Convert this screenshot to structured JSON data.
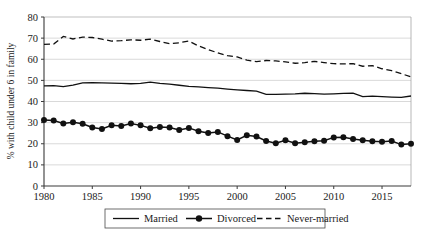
{
  "chart_data": {
    "type": "line",
    "title": "",
    "xlabel": "",
    "ylabel": "% with child under 6 in family",
    "xlim": [
      1980,
      2018
    ],
    "ylim": [
      0,
      80
    ],
    "ytick_step": 10,
    "xtick_step": 5,
    "grid": true,
    "legend_position": "bottom",
    "x": [
      1980,
      1981,
      1982,
      1983,
      1984,
      1985,
      1986,
      1987,
      1988,
      1989,
      1990,
      1991,
      1992,
      1993,
      1994,
      1995,
      1996,
      1997,
      1998,
      1999,
      2000,
      2001,
      2002,
      2003,
      2004,
      2005,
      2006,
      2007,
      2008,
      2009,
      2010,
      2011,
      2012,
      2013,
      2014,
      2015,
      2016,
      2017,
      2018
    ],
    "xticks": [
      1980,
      1985,
      1990,
      1995,
      2000,
      2005,
      2010,
      2015
    ],
    "yticks": [
      0,
      10,
      20,
      30,
      40,
      50,
      60,
      70,
      80
    ],
    "series": [
      {
        "name": "Married",
        "style": "solid",
        "marker": "none",
        "color": "#111111",
        "values": [
          47.4,
          47.5,
          47.0,
          47.8,
          48.8,
          48.9,
          48.8,
          48.7,
          48.6,
          48.4,
          48.6,
          49.2,
          48.6,
          48.2,
          47.7,
          47.2,
          46.9,
          46.6,
          46.3,
          45.9,
          45.5,
          45.2,
          44.9,
          43.4,
          43.4,
          43.5,
          43.6,
          43.9,
          43.7,
          43.5,
          43.6,
          43.8,
          44.0,
          42.3,
          42.5,
          42.3,
          42.1,
          42.0,
          42.6
        ]
      },
      {
        "name": "Divorced",
        "style": "solid",
        "marker": "filled-circle",
        "color": "#111111",
        "values": [
          31.2,
          31.0,
          29.6,
          30.2,
          29.5,
          27.7,
          27.0,
          28.7,
          28.4,
          29.6,
          28.7,
          27.3,
          27.9,
          27.7,
          26.5,
          27.5,
          25.9,
          25.1,
          25.6,
          23.6,
          21.8,
          24.0,
          23.4,
          21.3,
          20.2,
          21.6,
          20.2,
          20.7,
          21.2,
          21.4,
          23.0,
          23.1,
          22.2,
          21.7,
          21.2,
          20.9,
          21.3,
          19.6,
          20.0
        ]
      },
      {
        "name": "Never-married",
        "style": "dashed",
        "marker": "none",
        "color": "#111111",
        "values": [
          67.0,
          67.2,
          70.8,
          69.6,
          70.5,
          70.3,
          69.5,
          68.6,
          68.8,
          69.2,
          69.0,
          69.5,
          68.4,
          67.4,
          67.8,
          68.6,
          66.3,
          64.6,
          63.0,
          61.7,
          61.1,
          59.6,
          58.9,
          59.4,
          59.2,
          58.8,
          58.1,
          58.4,
          59.0,
          58.4,
          57.9,
          57.8,
          57.9,
          56.7,
          57.0,
          55.5,
          54.6,
          53.2,
          51.6
        ]
      }
    ],
    "legend_entries": [
      "Married",
      "Divorced",
      "Never-married"
    ]
  }
}
